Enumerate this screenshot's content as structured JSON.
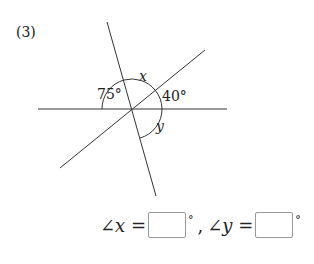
{
  "problem": {
    "number": "(3)",
    "labels": {
      "angle_75": "75°",
      "angle_40": "40°",
      "x": "x",
      "y": "y"
    }
  },
  "answer": {
    "x_prefix": "∠x =",
    "separator": ",",
    "y_prefix": "∠y =",
    "degree": "°",
    "x_value": "",
    "y_value": ""
  }
}
